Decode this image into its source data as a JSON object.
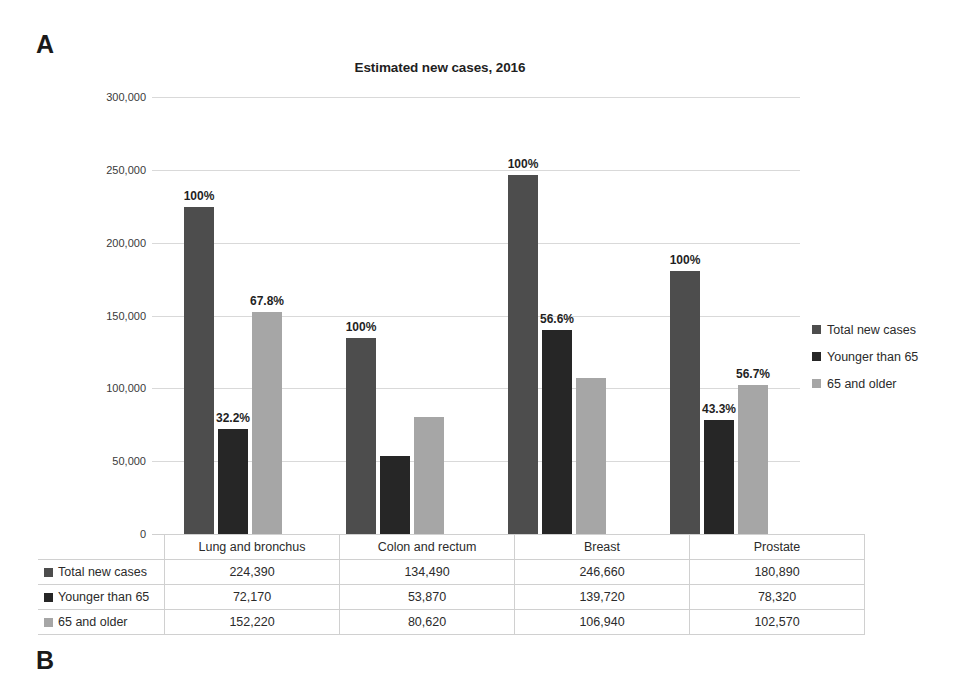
{
  "panels": {
    "a_label": "A",
    "b_label": "B"
  },
  "chart_data": {
    "type": "bar",
    "title": "Estimated new cases, 2016",
    "xlabel": "",
    "ylabel": "",
    "ylim": [
      0,
      300000
    ],
    "yticks": [
      "0",
      "50,000",
      "100,000",
      "150,000",
      "200,000",
      "250,000",
      "300,000"
    ],
    "ytick_values": [
      0,
      50000,
      100000,
      150000,
      200000,
      250000,
      300000
    ],
    "grid": true,
    "legend_position": "right",
    "categories": [
      "Lung and bronchus",
      "Colon and rectum",
      "Breast",
      "Prostate"
    ],
    "series": [
      {
        "name": "Total new cases",
        "color": "#4d4d4d",
        "values": [
          224390,
          134490,
          246660,
          180890
        ],
        "display_values": [
          "224,390",
          "134,490",
          "246,660",
          "180,890"
        ],
        "point_labels": [
          "100%",
          "100%",
          "100%",
          "100%"
        ]
      },
      {
        "name": "Younger than 65",
        "color": "#262626",
        "values": [
          72170,
          53870,
          139720,
          78320
        ],
        "display_values": [
          "72,170",
          "53,870",
          "139,720",
          "78,320"
        ],
        "point_labels": [
          "32.2%",
          "",
          "56.6%",
          "43.3%"
        ]
      },
      {
        "name": "65 and older",
        "color": "#a6a6a6",
        "values": [
          152220,
          80620,
          106940,
          102570
        ],
        "display_values": [
          "152,220",
          "80,620",
          "106,940",
          "102,570"
        ],
        "point_labels": [
          "67.8%",
          "",
          "",
          "56.7%"
        ]
      }
    ]
  },
  "legend": {
    "items": [
      {
        "label": "Total new cases",
        "color": "#4d4d4d"
      },
      {
        "label": "Younger than 65",
        "color": "#262626"
      },
      {
        "label": "65 and older",
        "color": "#a6a6a6"
      }
    ]
  },
  "table": {
    "corner": "",
    "column_headers": [
      "Lung and bronchus",
      "Colon and rectum",
      "Breast",
      "Prostate"
    ],
    "rows": [
      {
        "label": "Total new cases",
        "color": "#4d4d4d",
        "cells": [
          "224,390",
          "134,490",
          "246,660",
          "180,890"
        ]
      },
      {
        "label": "Younger than 65",
        "color": "#262626",
        "cells": [
          "72,170",
          "53,870",
          "139,720",
          "78,320"
        ]
      },
      {
        "label": "65 and older",
        "color": "#a6a6a6",
        "cells": [
          "152,220",
          "80,620",
          "106,940",
          "102,570"
        ]
      }
    ]
  }
}
